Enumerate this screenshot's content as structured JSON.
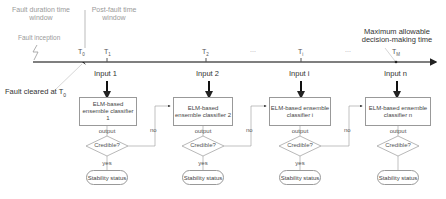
{
  "timeline": {
    "fault_window_label": "Fault duration time window",
    "post_fault_window_label": "Post-fault time window",
    "fault_inception_label": "Fault inception",
    "fault_cleared_label": "Fault cleared at T",
    "fault_cleared_sub": "0",
    "max_time_label_line1": "Maximum allowable",
    "max_time_label_line2": "decision-making time",
    "ellipsis": "...",
    "ticks": [
      {
        "label": "T",
        "sub": "0"
      },
      {
        "label": "T",
        "sub": "1"
      },
      {
        "label": "T",
        "sub": "2"
      },
      {
        "label": "T",
        "sub": "i"
      },
      {
        "label": "T",
        "sub": "M"
      }
    ]
  },
  "stages": [
    {
      "input": "Input 1",
      "classifier": "ELM-based ensemble classifier 1",
      "output": "output",
      "decision": "Credible?",
      "yes": "yes",
      "no": "no",
      "result": "Stability status"
    },
    {
      "input": "Input 2",
      "classifier": "ELM-based ensemble classifier 2",
      "output": "output",
      "decision": "Credible?",
      "yes": "yes",
      "no": "no",
      "result": "Stability status"
    },
    {
      "input": "Input i",
      "classifier": "ELM-based ensemble classifier i",
      "output": "output",
      "decision": "Credible?",
      "yes": "yes",
      "no": "no",
      "result": "Stability status"
    },
    {
      "input": "Input n",
      "classifier": "ELM-based ensemble classifier n",
      "output": "output",
      "decision": "Credible?",
      "result": "Stability status"
    }
  ]
}
